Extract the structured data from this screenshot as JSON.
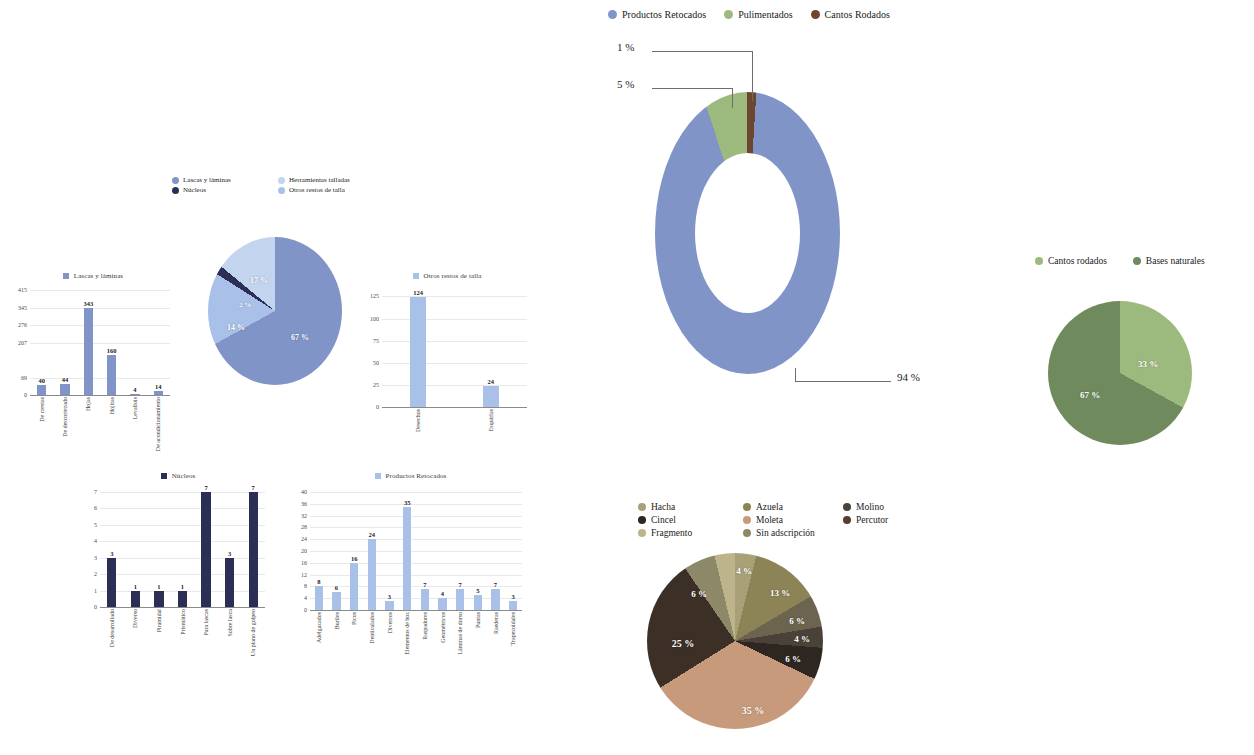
{
  "figure": {
    "background": "#ffffff"
  },
  "palette": {
    "blue_mid": "#8094c8",
    "blue_light": "#a9c0e8",
    "blue_pale": "#c3d4ef",
    "blue_dark": "#2b2f56",
    "green_light": "#9cb97e",
    "green_mid": "#8ba86f",
    "green_dark": "#6f8b5e",
    "brown_dark": "#6d4630",
    "label_white": "#ffffff"
  },
  "panel_lascas_bar": {
    "legend_label": "Lascas y láminas",
    "legend_color": "#8094c8",
    "chart_data": {
      "type": "bar",
      "title": "Lascas y láminas",
      "categories": [
        "De crestas",
        "De descortezado",
        "Hojas",
        "Hojitas",
        "Levallois",
        "De acondicionamiento"
      ],
      "values": [
        40,
        44,
        343,
        160,
        4,
        14
      ],
      "ylabel": "",
      "xlabel": "",
      "ylim": [
        0,
        415
      ],
      "yticks": [
        0,
        69,
        207,
        276,
        345,
        415
      ],
      "ytick_labels": [
        "0",
        "69",
        "207",
        "276",
        "345",
        "415"
      ],
      "grid": true,
      "series_color": "#8094c8"
    }
  },
  "panel_main_pie": {
    "legend": [
      {
        "label": "Lascas y láminas",
        "color": "#8094c8"
      },
      {
        "label": "Herramientas talladas",
        "color": "#c3d4ef"
      },
      {
        "label": "Núcleos",
        "color": "#2b2f56"
      },
      {
        "label": "Otros restos de talla",
        "color": "#a9c0e8"
      }
    ],
    "chart_data": {
      "type": "pie",
      "title": "",
      "categories": [
        "Lascas y láminas",
        "Otros restos de talla",
        "Núcleos",
        "Herramientas talladas"
      ],
      "values": [
        67,
        17,
        2,
        14
      ],
      "labels": [
        "67 %",
        "17 %",
        "2 %",
        "14 %"
      ],
      "colors": [
        "#8094c8",
        "#a9c0e8",
        "#2b2f56",
        "#c3d4ef"
      ]
    }
  },
  "panel_otros_bar": {
    "legend_label": "Otros restos de talla",
    "legend_color": "#a9c0e8",
    "chart_data": {
      "type": "bar",
      "title": "Otros restos de talla",
      "categories": [
        "Desechos",
        "Esquirlas"
      ],
      "values": [
        124,
        24
      ],
      "ylabel": "",
      "xlabel": "",
      "ylim": [
        0,
        130
      ],
      "yticks": [
        0,
        25,
        50,
        75,
        100,
        125
      ],
      "ytick_labels": [
        "0",
        "25",
        "50",
        "75",
        "100",
        "125"
      ],
      "grid": true,
      "series_color": "#a9c0e8"
    }
  },
  "panel_nucleos_bar": {
    "legend_label": "Núcleos",
    "legend_color": "#2b2f56",
    "chart_data": {
      "type": "bar",
      "title": "Núcleos",
      "categories": [
        "De desarrollado",
        "Diverso",
        "Piramidal",
        "Prismático",
        "Para lascas",
        "Sobre lasca",
        "Un plano de golpeo"
      ],
      "values": [
        3,
        1,
        1,
        1,
        7,
        3,
        7
      ],
      "ylabel": "",
      "xlabel": "",
      "ylim": [
        0,
        7
      ],
      "yticks": [
        0,
        1,
        2,
        3,
        4,
        5,
        6,
        7
      ],
      "ytick_labels": [
        "0",
        "1",
        "2",
        "3",
        "4",
        "5",
        "6",
        "7"
      ],
      "grid": true,
      "series_color": "#2b2f56"
    }
  },
  "panel_retocados_bar": {
    "legend_label": "Productos Retocados",
    "legend_color": "#a9c0e8",
    "chart_data": {
      "type": "bar",
      "title": "Productos Retocados",
      "categories": [
        "Adelgazados",
        "Buriles",
        "Picos",
        "Denticulados",
        "Diversos",
        "Elementos de hoz",
        "Raspadores",
        "Geométricos",
        "Láminas de dorso",
        "Puntas",
        "Raederas",
        "Trapezoidales"
      ],
      "values": [
        8,
        6,
        16,
        24,
        3,
        35,
        7,
        4,
        7,
        5,
        7,
        3
      ],
      "ylabel": "",
      "xlabel": "",
      "ylim": [
        0,
        40
      ],
      "yticks": [
        0,
        4,
        8,
        12,
        16,
        20,
        24,
        28,
        32,
        36,
        40
      ],
      "ytick_labels": [
        "0",
        "4",
        "8",
        "12",
        "16",
        "20",
        "24",
        "28",
        "32",
        "36",
        "40"
      ],
      "grid": true,
      "series_color": "#a9c0e8"
    }
  },
  "panel_donut": {
    "legend": [
      {
        "label": "Productos Retocados",
        "color": "#8094c8"
      },
      {
        "label": "Pulimentados",
        "color": "#9cb97e"
      },
      {
        "label": "Cantos Rodados",
        "color": "#6d4630"
      }
    ],
    "callouts": [
      {
        "text": "1 %",
        "series": "Cantos Rodados"
      },
      {
        "text": "5 %",
        "series": "Pulimentados"
      },
      {
        "text": "94 %",
        "series": "Productos Retocados"
      }
    ],
    "chart_data": {
      "type": "pie",
      "subtype": "donut",
      "title": "",
      "categories": [
        "Productos Retocados",
        "Pulimentados",
        "Cantos Rodados"
      ],
      "values": [
        94,
        5,
        1
      ],
      "labels": [
        "94 %",
        "5 %",
        "1 %"
      ],
      "colors": [
        "#8094c8",
        "#9cb97e",
        "#6d4630"
      ],
      "hole_ratio": 0.56
    }
  },
  "panel_cantos_pie": {
    "legend": [
      {
        "label": "Cantos rodados",
        "color": "#9cb97e"
      },
      {
        "label": "Bases naturales",
        "color": "#6f8b5e"
      }
    ],
    "chart_data": {
      "type": "pie",
      "title": "",
      "categories": [
        "Cantos rodados",
        "Bases naturales"
      ],
      "values": [
        33,
        67
      ],
      "labels": [
        "33 %",
        "67 %"
      ],
      "colors": [
        "#9cb97e",
        "#6f8b5e"
      ]
    }
  },
  "panel_pulimentados_pie": {
    "legend": [
      {
        "label": "Hacha",
        "color": "#a8a178"
      },
      {
        "label": "Azuela",
        "color": "#8c8456"
      },
      {
        "label": "Molino",
        "color": "#4a4238"
      },
      {
        "label": "Cincel",
        "color": "#2e2620"
      },
      {
        "label": "Moleta",
        "color": "#c89a7c"
      },
      {
        "label": "Percutor",
        "color": "#5a3a34"
      },
      {
        "label": "Fragmento",
        "color": "#bdb48c"
      },
      {
        "label": "Sin adscripción",
        "color": "#8d8868"
      }
    ],
    "chart_data": {
      "type": "pie",
      "title": "",
      "categories": [
        "Hacha",
        "Azuela",
        "Molino",
        "Percutor",
        "Cincel",
        "Moleta",
        "Fragmento",
        "Sin adscripción",
        "Otros"
      ],
      "values": [
        4,
        13,
        6,
        4,
        6,
        35,
        25,
        6,
        4
      ],
      "labels": [
        "4 %",
        "13 %",
        "6 %",
        "4 %",
        "6 %",
        "35 %",
        "25 %",
        "6 %",
        "4 %"
      ],
      "colors": [
        "#a8a178",
        "#8c8456",
        "#6d6450",
        "#4a4238",
        "#2e2620",
        "#c89a7c",
        "#3b2f26",
        "#8d8868",
        "#bdb48c"
      ]
    }
  }
}
